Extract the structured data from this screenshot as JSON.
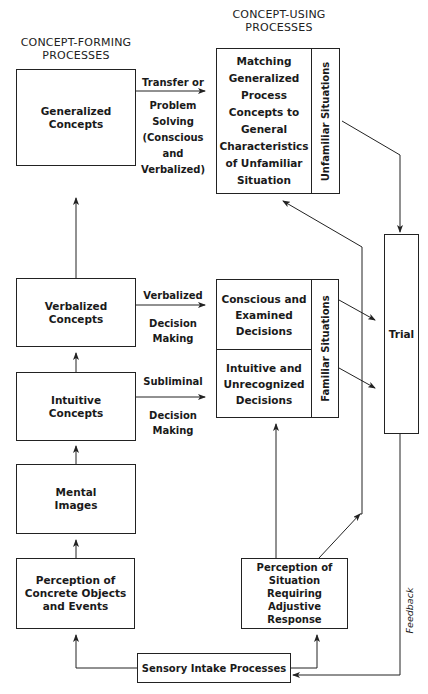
{
  "titles": {
    "concept_forming": "CONCEPT-FORMING\nPROCESSES",
    "concept_using": "CONCEPT-USING\nPROCESSES"
  },
  "forming_boxes": {
    "generalized": "Generalized\nConcepts",
    "verbalized": "Verbalized\nConcepts",
    "intuitive": "Intuitive\nConcepts",
    "mental": "Mental\nImages",
    "perception_concrete": "Perception of\nConcrete Objects\nand Events"
  },
  "arrow_labels": {
    "transfer_top": "Transfer or",
    "transfer_bottom": "Problem\nSolving\n(Conscious\nand\nVerbalized)",
    "verbalized_top": "Verbalized",
    "verbalized_bottom": "Decision\nMaking",
    "subliminal_top": "Subliminal",
    "subliminal_bottom": "Decision\nMaking"
  },
  "using_boxes": {
    "matching": "Matching\nGeneralized\nProcess\nConcepts to\nGeneral\nCharacteristics\nof Unfamiliar\nSituation",
    "unfamiliar_label": "Unfamiliar Situations",
    "conscious": "Conscious and\nExamined\nDecisions",
    "intuitive_decisions": "Intuitive and\nUnrecognized\nDecisions",
    "familiar_label": "Familiar Situations",
    "trial": "Trial",
    "perception_situation": "Perception of Situation\nRequiring\nAdjustive Response",
    "sensory": "Sensory Intake Processes",
    "feedback": "Feedback"
  },
  "colors": {
    "line": "#222222",
    "background": "#ffffff"
  }
}
